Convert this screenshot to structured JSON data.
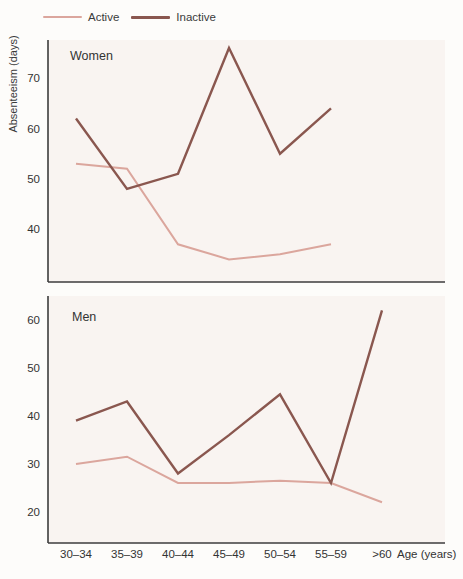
{
  "legend": {
    "items": [
      {
        "label": "Active",
        "color": "#dba69d"
      },
      {
        "label": "Inactive",
        "color": "#8a574f"
      }
    ]
  },
  "ylabel": "Absenteeism (days)",
  "xlabel": "Age (years)",
  "colors": {
    "active_line": "#dba69d",
    "inactive_line": "#8a574f",
    "axis": "#3c3c3c",
    "text": "#333333",
    "plot_background": "#f9f4f1",
    "page_background": "#fdfcfa"
  },
  "chart_data": [
    {
      "type": "line",
      "title": "Women",
      "categories": [
        "30–34",
        "35–39",
        "40–44",
        "45–49",
        "50–54",
        "55–59",
        ">60"
      ],
      "yticks": [
        40,
        50,
        60,
        70
      ],
      "ylim": [
        29.5,
        77.6
      ],
      "show_x_labels": false,
      "series": [
        {
          "name": "Active",
          "values": [
            53,
            52,
            37,
            34,
            35,
            37
          ]
        },
        {
          "name": "Inactive",
          "values": [
            62,
            48,
            51,
            76,
            55,
            64
          ]
        }
      ]
    },
    {
      "type": "line",
      "title": "Men",
      "categories": [
        "30–34",
        "35–39",
        "40–44",
        "45–49",
        "50–54",
        "55–59",
        ">60"
      ],
      "yticks": [
        20,
        30,
        40,
        50,
        60
      ],
      "ylim": [
        13.5,
        65
      ],
      "show_x_labels": true,
      "xlabel": "Age (years)",
      "series": [
        {
          "name": "Active",
          "values": [
            30,
            31.5,
            26,
            26,
            26.5,
            26,
            22
          ]
        },
        {
          "name": "Inactive",
          "values": [
            39,
            43,
            28,
            36,
            44.5,
            26,
            62
          ]
        }
      ]
    }
  ]
}
